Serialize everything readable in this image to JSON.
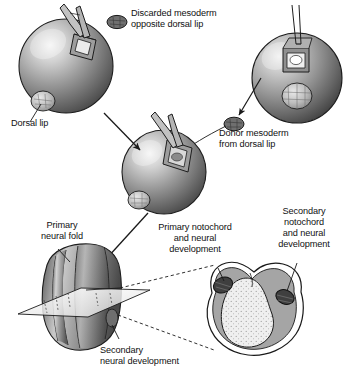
{
  "figure": {
    "background_color": "#ffffff",
    "text_color": "#111111"
  },
  "labels": {
    "discarded_mesoderm": "Discarded mesoderm\nopposite dorsal lip",
    "dorsal_lip": "Dorsal lip",
    "donor_mesoderm": "Donor mesoderm\nfrom dorsal lip",
    "primary_neural_fold": "Primary\nneural fold",
    "secondary_neural_development": "Secondary\nneural development",
    "primary_notochord": "Primary notochord\nand neural\ndevelopment",
    "secondary_notochord": "Secondary\nnotochord\nand neural\ndevelopment"
  },
  "structures": {
    "host_embryo": "host blastula with forceps removing ventral mesoderm",
    "donor_embryo": "donor blastula with pipette at dorsal lip",
    "grafted_embryo": "host blastula receiving donor graft",
    "neurula": "neurula with primary and secondary neural folds",
    "cross_section": "transverse section showing two notochords"
  },
  "colors": {
    "embryo_dark": "#4c4c4c",
    "embryo_mid": "#8a8a8a",
    "embryo_light": "#d8d8d8",
    "embryo_highlight": "#f2f2f2",
    "outline": "#1a1a1a",
    "mesoderm_blob": "#6a6a6a",
    "yolk_fill": "#efefef",
    "neural_gray": "#9a9a9a",
    "notochord_dark": "#3a3a3a"
  }
}
